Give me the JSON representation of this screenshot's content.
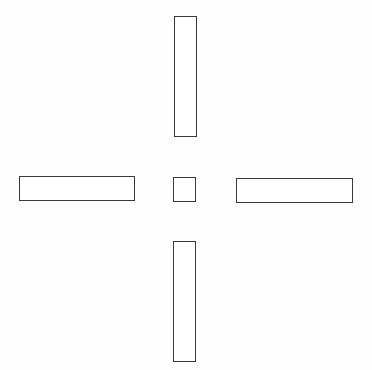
{
  "diagram": {
    "type": "cross-of-rectangles",
    "stroke_color": "#3a3a3a",
    "fill_color": "#ffffff",
    "shapes": [
      {
        "id": "top",
        "x": 174,
        "y": 16,
        "w": 23,
        "h": 121
      },
      {
        "id": "left",
        "x": 19,
        "y": 176,
        "w": 116,
        "h": 25
      },
      {
        "id": "center",
        "x": 173,
        "y": 177,
        "w": 23,
        "h": 25
      },
      {
        "id": "right",
        "x": 236,
        "y": 178,
        "w": 117,
        "h": 25
      },
      {
        "id": "bottom",
        "x": 173,
        "y": 241,
        "w": 23,
        "h": 121
      }
    ]
  }
}
